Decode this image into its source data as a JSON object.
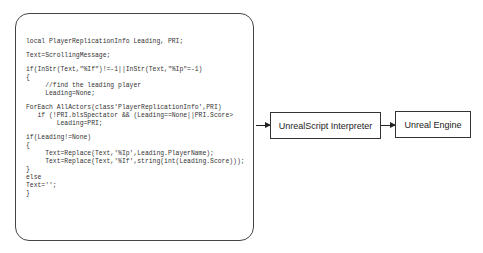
{
  "diagram": {
    "code_lines": [
      "local PlayerReplicationInfo Leading, PRI;",
      "",
      "Text=ScrollingMessage;",
      "",
      "if(InStr(Text,\"%If\")!=-1||InStr(Text,\"%Ip\"=-1)",
      "{",
      "     //find the leading player",
      "     Leading=None;",
      "",
      "ForEach AllActors(class'PlayerReplicationInfo',PRI)",
      "   if (!PRI.blsSpectator && (Leading==None||PRI.Score>",
      "        Leading=PRI;",
      "",
      "if(Leading!=None)",
      "{",
      "     Text=Replace(Text,'%Ip',Leading.PlayerName);",
      "     Text=Replace(Text,'%If',string(int(Leading.Score)));",
      "}",
      "else",
      "Text='';",
      "}"
    ],
    "nodes": {
      "interpreter": "UnrealScript Interpreter",
      "engine": "Unreal Engine"
    }
  }
}
